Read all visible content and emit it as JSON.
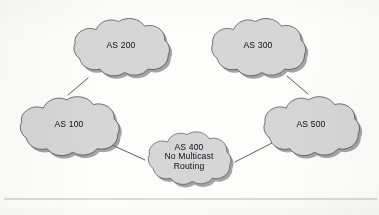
{
  "figure": {
    "type": "network-topology-diagram",
    "title": "",
    "background_color": "#fdfdfc",
    "cloud_fill": "#d6d6d6",
    "cloud_stroke": "#3a3a3f",
    "shadow_color": "#6e6e73",
    "link_color": "#4a4a50",
    "text_color": "#1b1b22"
  },
  "nodes": [
    {
      "id": "as200",
      "label": "AS 200",
      "lines": [
        "AS 200"
      ],
      "cx": 121,
      "cy": 47,
      "rx": 59,
      "ry": 36
    },
    {
      "id": "as300",
      "label": "AS 300",
      "lines": [
        "AS 300"
      ],
      "cx": 258,
      "cy": 47,
      "rx": 58,
      "ry": 36
    },
    {
      "id": "as100",
      "label": "AS 100",
      "lines": [
        "AS 100"
      ],
      "cx": 69,
      "cy": 126,
      "rx": 61,
      "ry": 37
    },
    {
      "id": "as400",
      "label": "AS 400 No Multicast Routing",
      "lines": [
        "AS 400",
        "No Multicast",
        "Routing"
      ],
      "cx": 189,
      "cy": 158,
      "rx": 51,
      "ry": 33
    },
    {
      "id": "as500",
      "label": "AS 500",
      "lines": [
        "AS 500"
      ],
      "cx": 311,
      "cy": 126,
      "rx": 59,
      "ry": 37
    }
  ],
  "links": [
    {
      "id": "link-as200-as300",
      "from": "AS 200",
      "to": "AS 300",
      "x1": 177,
      "y1": 44,
      "x2": 204,
      "y2": 44
    },
    {
      "id": "link-as200-as100",
      "from": "AS 200",
      "to": "AS 100",
      "x1": 88,
      "y1": 78,
      "x2": 68,
      "y2": 95
    },
    {
      "id": "link-as300-as500",
      "from": "AS 300",
      "to": "AS 500",
      "x1": 287,
      "y1": 76,
      "x2": 308,
      "y2": 94
    },
    {
      "id": "link-as100-as400",
      "from": "AS 100",
      "to": "AS 400",
      "x1": 112,
      "y1": 145,
      "x2": 145,
      "y2": 160
    },
    {
      "id": "link-as400-as500",
      "from": "AS 400",
      "to": "AS 500",
      "x1": 235,
      "y1": 162,
      "x2": 272,
      "y2": 143
    }
  ],
  "page_rule": {
    "id": "page-rule",
    "y": 199,
    "x1": 4,
    "x2": 377,
    "color": "#b9b9bd"
  }
}
